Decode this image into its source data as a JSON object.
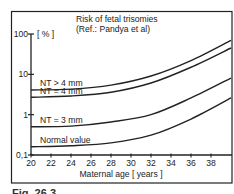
{
  "chart_data": {
    "type": "line",
    "title": "Risk of fetal trisomies",
    "subtitle": "(Ref.: Pandya et al)",
    "xlabel": "Maternal age [ years ]",
    "ylabel": "[ % ]",
    "yscale": "log",
    "xlim": [
      20,
      40
    ],
    "ylim": [
      0.1,
      100
    ],
    "x_ticks": [
      20,
      22,
      24,
      26,
      28,
      30,
      32,
      34,
      36,
      38
    ],
    "y_ticks": [
      {
        "value": 0.1,
        "label": "0,1"
      },
      {
        "value": 1,
        "label": "1"
      },
      {
        "value": 10,
        "label": "10"
      },
      {
        "value": 100,
        "label": "100"
      }
    ],
    "grid": false,
    "legend_position": "inline labels above curves",
    "x": [
      20,
      24,
      28,
      32,
      36,
      40
    ],
    "series": [
      {
        "name": "NT > 4 mm",
        "values": [
          4.1,
          4.3,
          5.4,
          9.1,
          22,
          70
        ]
      },
      {
        "name": "NT = 4 mm",
        "values": [
          2.7,
          2.9,
          3.6,
          6.1,
          15,
          45
        ]
      },
      {
        "name": "NT = 3 mm",
        "values": [
          0.5,
          0.52,
          0.66,
          1.0,
          2.6,
          8.1
        ]
      },
      {
        "name": "Normal value",
        "values": [
          0.16,
          0.17,
          0.2,
          0.31,
          0.78,
          2.6
        ]
      }
    ]
  },
  "labels": {
    "title": "Risk of fetal trisomies",
    "subtitle": "(Ref.: Pandya et al)",
    "y_unit": "[ % ]",
    "x_axis": "Maternal age [ years ]",
    "caption": "Fig. 26.3"
  },
  "colors": {
    "line": "#222222",
    "frame": "#222222",
    "background": "#ffffff"
  }
}
